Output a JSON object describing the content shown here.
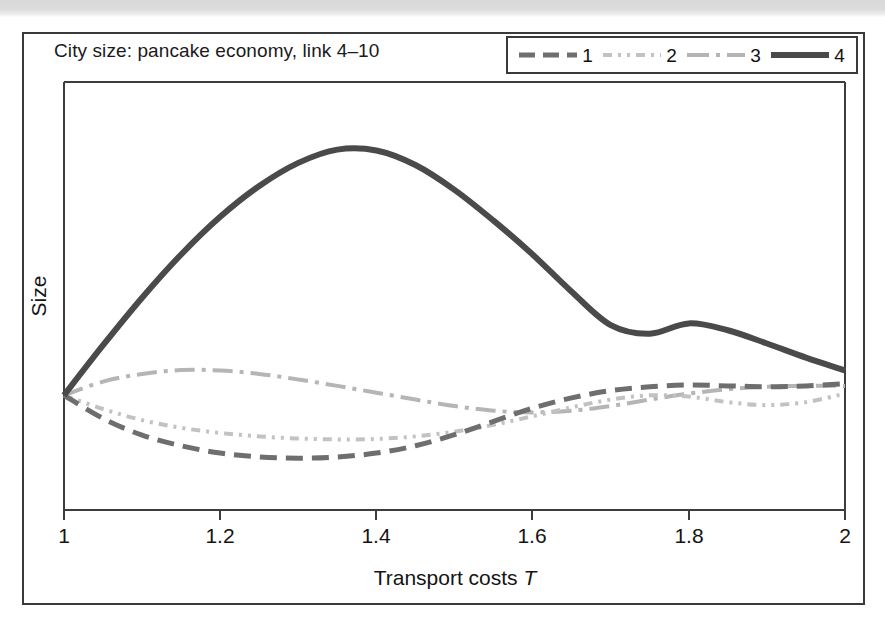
{
  "figure": {
    "title": "City size: pancake economy, link 4–10",
    "background_color": "#ffffff",
    "border_color": "#3a3a3a"
  },
  "legend": {
    "position": "top-right",
    "entries": [
      {
        "label": "1",
        "style": "dashed",
        "color": "#6e6e6e",
        "width": 5
      },
      {
        "label": "2",
        "style": "dash-dot-dot",
        "color": "#c2c2c2",
        "width": 4
      },
      {
        "label": "3",
        "style": "dash-dot",
        "color": "#b5b5b5",
        "width": 4
      },
      {
        "label": "4",
        "style": "solid",
        "color": "#4a4a4a",
        "width": 6
      }
    ]
  },
  "axes": {
    "xlabel": "Transport costs ",
    "xlabel_symbol": "T",
    "ylabel": "Size",
    "xticks": [
      "1",
      "1.2",
      "1.4",
      "1.6",
      "1.8",
      "2"
    ],
    "xlim": [
      1,
      2
    ],
    "yticks": [],
    "grid": false
  },
  "chart_data": {
    "type": "line",
    "title": "City size: pancake economy, link 4–10",
    "xlabel": "Transport costs T",
    "ylabel": "Size",
    "xlim": [
      1,
      2
    ],
    "ylim": [
      0,
      1
    ],
    "grid": false,
    "legend_position": "top-right",
    "x": [
      1.0,
      1.05,
      1.1,
      1.15,
      1.2,
      1.25,
      1.3,
      1.35,
      1.4,
      1.45,
      1.5,
      1.55,
      1.6,
      1.65,
      1.7,
      1.75,
      1.8,
      1.85,
      1.9,
      1.95,
      2.0
    ],
    "series": [
      {
        "name": "1",
        "style": "dashed",
        "color": "#6e6e6e",
        "values": [
          0.268,
          0.214,
          0.175,
          0.15,
          0.133,
          0.124,
          0.121,
          0.124,
          0.133,
          0.15,
          0.176,
          0.207,
          0.238,
          0.262,
          0.279,
          0.288,
          0.292,
          0.29,
          0.288,
          0.29,
          0.295
        ]
      },
      {
        "name": "2",
        "style": "dash-dot-dot",
        "color": "#c2c2c2",
        "values": [
          0.268,
          0.236,
          0.21,
          0.192,
          0.18,
          0.172,
          0.167,
          0.165,
          0.166,
          0.172,
          0.183,
          0.199,
          0.219,
          0.24,
          0.258,
          0.268,
          0.265,
          0.252,
          0.245,
          0.252,
          0.272
        ]
      },
      {
        "name": "3",
        "style": "dash-dot",
        "color": "#b5b5b5",
        "values": [
          0.268,
          0.3,
          0.318,
          0.327,
          0.326,
          0.318,
          0.305,
          0.29,
          0.274,
          0.258,
          0.243,
          0.232,
          0.228,
          0.232,
          0.243,
          0.258,
          0.272,
          0.282,
          0.288,
          0.29,
          0.29
        ]
      },
      {
        "name": "4",
        "style": "solid",
        "color": "#4a4a4a",
        "values": [
          0.268,
          0.385,
          0.496,
          0.597,
          0.685,
          0.757,
          0.811,
          0.842,
          0.84,
          0.806,
          0.748,
          0.676,
          0.597,
          0.51,
          0.432,
          0.412,
          0.436,
          0.42,
          0.389,
          0.356,
          0.326
        ]
      }
    ]
  }
}
